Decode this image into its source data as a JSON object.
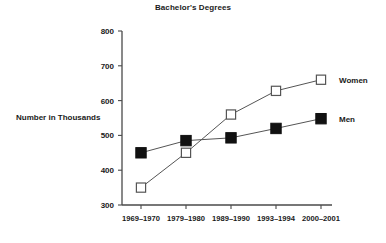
{
  "chart_data": {
    "type": "line",
    "title": "Bachelor's Degrees",
    "xlabel": "",
    "ylabel": "Number in Thousands",
    "categories": [
      "1969–1970",
      "1979–1980",
      "1989–1990",
      "1993–1994",
      "2000–2001"
    ],
    "ylim": [
      300,
      800
    ],
    "yticks": [
      300,
      400,
      500,
      600,
      700,
      800
    ],
    "ytick_labels": [
      "300",
      "400",
      "500",
      "600",
      "700",
      "800"
    ],
    "grid": false,
    "legend_position": "right-inline",
    "series": [
      {
        "name": "Women",
        "marker": "open-square",
        "color": "#ffffff",
        "edge_color": "#555555",
        "values": [
          350,
          450,
          560,
          628,
          660
        ]
      },
      {
        "name": "Men",
        "marker": "filled-square",
        "color": "#111111",
        "edge_color": "#111111",
        "values": [
          450,
          485,
          493,
          520,
          548
        ]
      }
    ]
  },
  "labels": {
    "title": "Bachelor's Degrees",
    "y_axis_title": "Number in Thousands",
    "series_women": "Women",
    "series_men": "Men"
  }
}
